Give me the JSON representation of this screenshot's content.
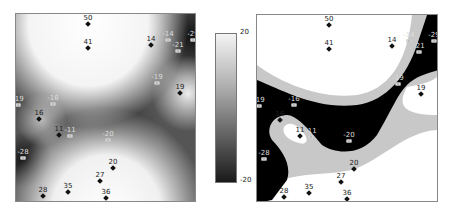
{
  "chart_data": [
    {
      "type": "heatmap",
      "title": "",
      "subtitle": "Continuous interpolated surface",
      "xlabel": "",
      "ylabel": "",
      "colorbar": {
        "min": -20,
        "max": 20,
        "labels": [
          "20",
          "-20"
        ],
        "colors": [
          "#f4f4f4",
          "#1a1a1a"
        ]
      },
      "points": [
        {
          "label": "50",
          "x": 87,
          "y": 23,
          "value": 50,
          "marker": "filled"
        },
        {
          "label": "41",
          "x": 87,
          "y": 47,
          "value": 41,
          "marker": "filled"
        },
        {
          "label": "14",
          "x": 150,
          "y": 44,
          "value": 14,
          "marker": "filled"
        },
        {
          "label": "-14",
          "x": 167,
          "y": 39,
          "value": -14,
          "marker": "square"
        },
        {
          "label": "-29",
          "x": 192,
          "y": 39,
          "value": -29,
          "marker": "square"
        },
        {
          "label": "-21",
          "x": 177,
          "y": 50,
          "value": -21,
          "marker": "square"
        },
        {
          "label": "-19",
          "x": 156,
          "y": 82,
          "value": -19,
          "marker": "square"
        },
        {
          "label": "19",
          "x": 179,
          "y": 92,
          "value": 19,
          "marker": "filled"
        },
        {
          "label": "-19",
          "x": 17,
          "y": 104,
          "value": -19,
          "marker": "square"
        },
        {
          "label": "-16",
          "x": 52,
          "y": 103,
          "value": -16,
          "marker": "square"
        },
        {
          "label": "16",
          "x": 38,
          "y": 118,
          "value": 16,
          "marker": "filled"
        },
        {
          "label": "11",
          "x": 58,
          "y": 134,
          "value": 11,
          "marker": "filled"
        },
        {
          "label": "-11",
          "x": 69,
          "y": 135,
          "value": -11,
          "marker": "square"
        },
        {
          "label": "-20",
          "x": 107,
          "y": 139,
          "value": -20,
          "marker": "square"
        },
        {
          "label": "-28",
          "x": 22,
          "y": 157,
          "value": -28,
          "marker": "square"
        },
        {
          "label": "20",
          "x": 112,
          "y": 167,
          "value": 20,
          "marker": "filled"
        },
        {
          "label": "27",
          "x": 99,
          "y": 180,
          "value": 27,
          "marker": "filled"
        },
        {
          "label": "28",
          "x": 42,
          "y": 195,
          "value": 28,
          "marker": "filled"
        },
        {
          "label": "35",
          "x": 67,
          "y": 191,
          "value": 35,
          "marker": "filled"
        },
        {
          "label": "36",
          "x": 105,
          "y": 197,
          "value": 36,
          "marker": "filled"
        }
      ]
    },
    {
      "type": "heatmap",
      "title": "",
      "subtitle": "Classified surface (3 classes: white high, gray mid, black low)",
      "classes": [
        {
          "name": "high",
          "color": "#ffffff"
        },
        {
          "name": "mid",
          "color": "#c8c8c8"
        },
        {
          "name": "low",
          "color": "#000000"
        }
      ],
      "points_same_as_left": true
    }
  ],
  "colorbar": {
    "top_label": "20",
    "bottom_label": "-20"
  }
}
